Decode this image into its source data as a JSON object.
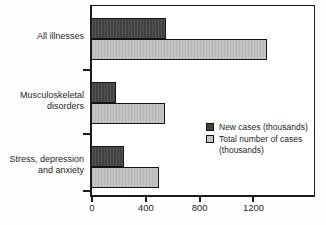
{
  "figure": {
    "background": "#ffffff",
    "text_color": "#262626",
    "axis_color": "#1c1c1c"
  },
  "chart_data": {
    "type": "bar",
    "orientation": "horizontal",
    "title": "",
    "xlabel": "",
    "ylabel": "",
    "categories": [
      "All illnesses",
      "Musculoskeletal disorders",
      "Stress, depression and anxiety"
    ],
    "category_label_lines": [
      [
        "All illnesses"
      ],
      [
        "Musculoskeletal",
        "disorders"
      ],
      [
        "Stress, depression",
        "and anxiety"
      ]
    ],
    "series": [
      {
        "name": "New cases (thousands)",
        "color": "#424242",
        "values": [
          550,
          180,
          240
        ]
      },
      {
        "name": "Total number of cases (thousands)",
        "color": "#c4c4c4",
        "values": [
          1300,
          540,
          500
        ]
      }
    ],
    "xlim": [
      0,
      1650
    ],
    "xticks": [
      0,
      400,
      800,
      1200
    ],
    "grid": false,
    "legend_position": "inside-right",
    "legend_labels": [
      "New cases (thousands)",
      "Total number of cases (thousands)"
    ]
  }
}
